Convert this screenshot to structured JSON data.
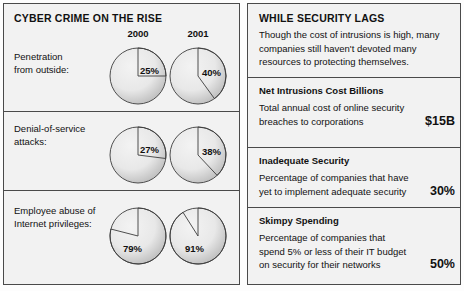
{
  "left": {
    "title": "CYBER CRIME ON THE RISE",
    "year_headers": [
      "2000",
      "2001"
    ],
    "rows": [
      {
        "label": "Penetration\nfrom outside:",
        "values": [
          "25%",
          "40%"
        ]
      },
      {
        "label": "Denial-of-service\nattacks:",
        "values": [
          "27%",
          "38%"
        ]
      },
      {
        "label": "Employee abuse of\nInternet privileges:",
        "values": [
          "79%",
          "91%"
        ]
      }
    ]
  },
  "right": {
    "title": "WHILE SECURITY LAGS",
    "intro": "Though the cost of intrusions is high, many companies still haven't devoted many resources to protecting themselves.",
    "sections": [
      {
        "heading": "Net Intrusions Cost Billions",
        "description": "Total annual cost of online security breaches to corporations",
        "value": "$15B"
      },
      {
        "heading": "Inadequate Security",
        "description": "Percentage of companies that have yet to implement adequate security",
        "value": "30%"
      },
      {
        "heading": "Skimpy Spending",
        "description": "Percentage of companies that spend 5% or less of their IT budget on security for their networks",
        "value": "50%"
      }
    ]
  },
  "chart_data": {
    "type": "pie",
    "title": "CYBER CRIME ON THE RISE",
    "categories": [
      "2000",
      "2001"
    ],
    "series": [
      {
        "name": "Penetration from outside",
        "values": [
          25,
          40
        ]
      },
      {
        "name": "Denial-of-service attacks",
        "values": [
          27,
          38
        ]
      },
      {
        "name": "Employee abuse of Internet privileges",
        "values": [
          79,
          91
        ]
      }
    ],
    "units": "percent",
    "legend": "none",
    "grid": false
  },
  "colors": {
    "panel_background": "#f2f2f2",
    "page_background": "#ffffff",
    "border": "#4a4a4a",
    "text": "#111111",
    "pie_fill_light": "#e8e8e8",
    "pie_fill_dark": "#b4b4b4",
    "pie_outline": "#3c3c3c"
  }
}
